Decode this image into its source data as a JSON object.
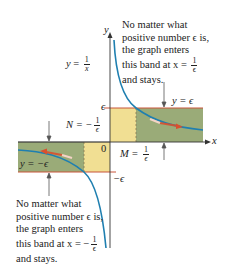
{
  "diagram": {
    "function_label": {
      "lhs": "y",
      "eq": " = ",
      "num": "1",
      "den": "x"
    },
    "axes": {
      "x_label": "x",
      "y_label": "y",
      "origin_label": "0"
    },
    "tick_labels": {
      "eps": "ϵ",
      "neg_eps": "−ϵ"
    },
    "band_labels": {
      "upper": "y = ϵ",
      "lower": "y = −ϵ"
    },
    "M_label": {
      "lhs": "M = ",
      "num": "1",
      "den": "ϵ"
    },
    "N_label": {
      "lhs": "N = −",
      "num": "1",
      "den": "ϵ"
    },
    "top_note": {
      "lines": [
        "No matter what",
        "positive number ϵ is,",
        "the graph enters",
        "this band at x = "
      ],
      "frac_num": "1",
      "frac_den": "ϵ",
      "last": "and stays."
    },
    "bottom_note": {
      "lines": [
        "No matter what",
        "positive number ϵ is,",
        "the graph enters",
        "this band at x = −"
      ],
      "frac_num": "1",
      "frac_den": "ϵ",
      "last": "and stays."
    },
    "colors": {
      "band_green": "#9aab78",
      "band_yellow": "#f1df93",
      "curve": "#1f7fb0",
      "band_edge": "#c8553a",
      "arrow": "#d9502e",
      "axis": "#333333"
    }
  }
}
